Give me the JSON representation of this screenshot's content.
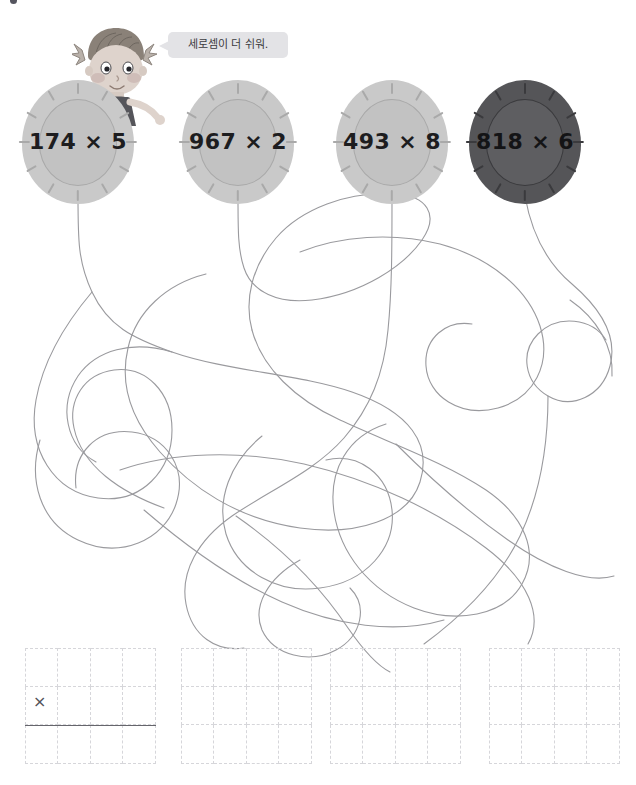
{
  "page": {
    "top_cut_text": "",
    "background_color": "#ffffff",
    "width": 636,
    "height": 785
  },
  "character": {
    "name": "girl-with-pigtails",
    "speech_bubble": {
      "text": "세로셈이 더 쉬워.",
      "background_color": "#e3e3e6",
      "text_color": "#3b3b40"
    }
  },
  "balloons": [
    {
      "id": "balloon-1",
      "expression": "174 × 5",
      "operand_a": 174,
      "operand_b": 5,
      "operator": "×",
      "style": "light",
      "fill_color": "#c9c9c9",
      "inner_color": "#c2c2c2",
      "text_color": "#1d1d1f"
    },
    {
      "id": "balloon-2",
      "expression": "967 × 2",
      "operand_a": 967,
      "operand_b": 2,
      "operator": "×",
      "style": "light",
      "fill_color": "#c9c9c9",
      "inner_color": "#c2c2c2",
      "text_color": "#1d1d1f"
    },
    {
      "id": "balloon-3",
      "expression": "493 × 8",
      "operand_a": 493,
      "operand_b": 8,
      "operator": "×",
      "style": "light",
      "fill_color": "#c9c9c9",
      "inner_color": "#c2c2c2",
      "text_color": "#1d1d1f"
    },
    {
      "id": "balloon-4",
      "expression": "818 × 6",
      "operand_a": 818,
      "operand_b": 6,
      "operator": "×",
      "style": "dark",
      "fill_color": "#555558",
      "inner_color": "#5e5e61",
      "text_color": "#141416"
    }
  ],
  "answer_grids": [
    {
      "id": "answer-grid-1",
      "columns": 4,
      "rows": 3,
      "times_symbol": "×",
      "has_sum_rule": true,
      "values": [
        [
          "",
          "",
          "",
          ""
        ],
        [
          "",
          "",
          "",
          ""
        ],
        [
          "",
          "",
          "",
          ""
        ]
      ]
    },
    {
      "id": "answer-grid-2",
      "columns": 4,
      "rows": 3,
      "times_symbol": "",
      "has_sum_rule": false,
      "values": [
        [
          "",
          "",
          "",
          ""
        ],
        [
          "",
          "",
          "",
          ""
        ],
        [
          "",
          "",
          "",
          ""
        ]
      ]
    },
    {
      "id": "answer-grid-3",
      "columns": 4,
      "rows": 3,
      "times_symbol": "",
      "has_sum_rule": false,
      "values": [
        [
          "",
          "",
          "",
          ""
        ],
        [
          "",
          "",
          "",
          ""
        ],
        [
          "",
          "",
          "",
          ""
        ]
      ]
    },
    {
      "id": "answer-grid-4",
      "columns": 4,
      "rows": 3,
      "times_symbol": "",
      "has_sum_rule": false,
      "values": [
        [
          "",
          "",
          "",
          ""
        ],
        [
          "",
          "",
          "",
          ""
        ],
        [
          "",
          "",
          "",
          ""
        ]
      ]
    }
  ],
  "strings": {
    "stroke_color": "#9a9a9e",
    "stroke_width": 1.1,
    "description": "tangled balloon strings maze"
  }
}
